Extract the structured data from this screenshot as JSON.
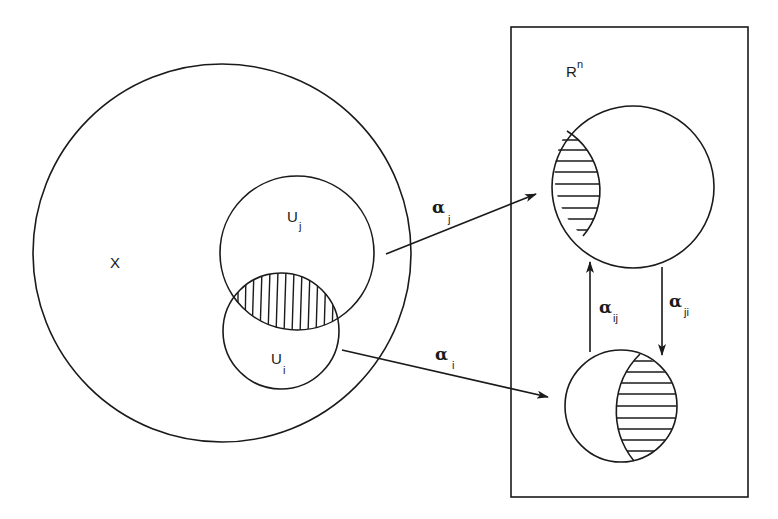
{
  "diagram": {
    "type": "manifold-chart-transition",
    "labels": {
      "space": "X",
      "euclidean_base": "R",
      "euclidean_exp": "n",
      "open_set_j_base": "U",
      "open_set_j_sub": "j",
      "open_set_i_base": "U",
      "open_set_i_sub": "i",
      "chart_j_base": "α",
      "chart_j_sub": "j",
      "chart_i_base": "α",
      "chart_i_sub": "i",
      "transition_ij_base": "α",
      "transition_ij_sub": "ij",
      "transition_ji_base": "α",
      "transition_ji_sub": "ji"
    },
    "shapes": {
      "X": {
        "cx": 222,
        "cy": 253,
        "r": 189
      },
      "U_j": {
        "cx": 297,
        "cy": 253,
        "r": 77
      },
      "U_i": {
        "cx": 281,
        "cy": 331,
        "r": 58
      },
      "Rn_box": {
        "x": 511,
        "y": 27,
        "w": 237,
        "h": 470
      },
      "image_j": {
        "cx": 633,
        "cy": 187,
        "r": 81
      },
      "image_i": {
        "cx": 621,
        "cy": 406,
        "r": 56
      }
    },
    "colors": {
      "stroke": "#1a1a1a",
      "background": "#ffffff"
    }
  }
}
